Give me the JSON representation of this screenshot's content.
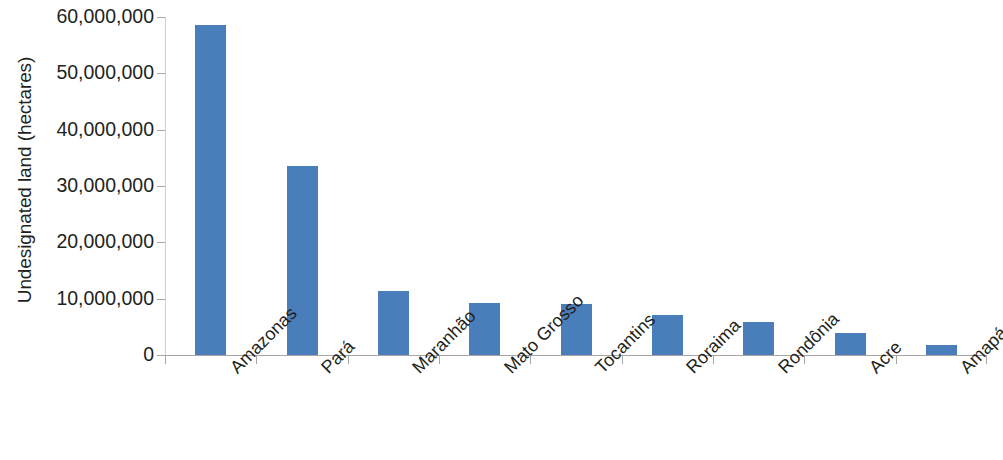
{
  "chart_data": {
    "type": "bar",
    "title": "",
    "xlabel": "",
    "ylabel": "Undesignated land (hectares)",
    "categories": [
      "Amazonas",
      "Pará",
      "Maranhão",
      "Mato Grosso",
      "Tocantins",
      "Roraima",
      "Rondônia",
      "Acre",
      "Amapá"
    ],
    "values": [
      58500000,
      33600000,
      11300000,
      9300000,
      9100000,
      7100000,
      5800000,
      3900000,
      1700000
    ],
    "ylim": [
      0,
      60000000
    ],
    "y_ticks": [
      0,
      10000000,
      20000000,
      30000000,
      40000000,
      50000000,
      60000000
    ],
    "y_tick_labels": [
      "0",
      "10,000,000",
      "20,000,000",
      "30,000,000",
      "40,000,000",
      "50,000,000",
      "60,000,000"
    ],
    "grid": false,
    "legend": false,
    "series_color": "#4A7EBB"
  },
  "axes": {
    "y_title": "Undesignated land (hectares)",
    "y_labels": [
      "60,000,000",
      "50,000,000",
      "40,000,000",
      "30,000,000",
      "20,000,000",
      "10,000,000",
      "0"
    ]
  },
  "colors": {
    "bar": "#4A7EBB",
    "axis": "#a6a6a6",
    "text": "#231f20",
    "background": "#ffffff"
  }
}
